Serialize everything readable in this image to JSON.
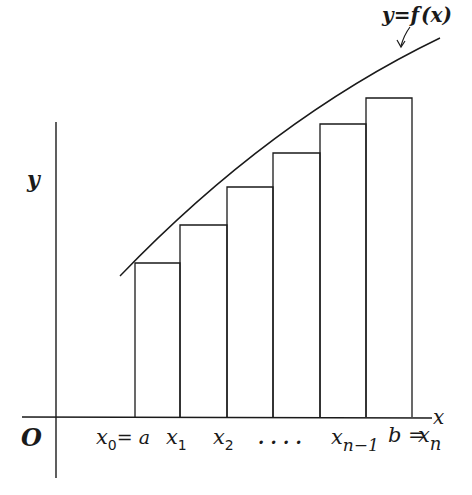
{
  "diagram": {
    "curve_label": "y = f (x)",
    "curve_label_parts": {
      "y": "y",
      "eq": "=",
      "f": "f",
      "arg": "(x)"
    },
    "axes": {
      "x_label": "x",
      "y_label": "y",
      "origin_label": "O"
    },
    "x_ticks": [
      {
        "main": "x",
        "sub": "0",
        "suffix": "= a"
      },
      {
        "main": "x",
        "sub": "1",
        "suffix": ""
      },
      {
        "main": "x",
        "sub": "2",
        "suffix": ""
      },
      {
        "main": "",
        "sub": "",
        "suffix": ". . . ."
      },
      {
        "main": "x",
        "sub": "n−1",
        "suffix": ""
      },
      {
        "main": "b =",
        "sub": "",
        "suffix": ""
      },
      {
        "main": "x",
        "sub": "n",
        "suffix": ""
      }
    ],
    "partition_x_px": [
      135,
      180,
      227,
      273,
      320,
      366,
      412
    ],
    "rect_heights_px": [
      263,
      225,
      187,
      153,
      124,
      98
    ],
    "colors": {
      "line": "#1a1a1a",
      "background": "#ffffff"
    }
  }
}
